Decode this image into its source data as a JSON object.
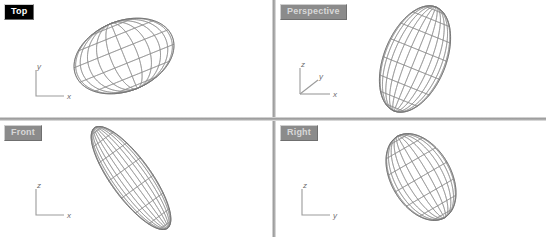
{
  "app": {
    "title": "CAD Modeler — Four Viewport Layout",
    "background_color": "#ffffff",
    "divider_color": "#9a9a9a",
    "wire_color": "#8e8e8e",
    "axis_color": "#9b9b9b"
  },
  "viewports": [
    {
      "id": "top",
      "label": "Top",
      "state": "active",
      "label_bg": "#000000",
      "label_fg": "#ffffff",
      "axes": [
        {
          "name": "y",
          "direction": "up"
        },
        {
          "name": "x",
          "direction": "right"
        }
      ],
      "object": {
        "name": "ellipsoid-wireframe",
        "shape": "ellipsoid",
        "rotation_deg": -22,
        "radius_x": 52,
        "radius_y": 35,
        "center_x": 124,
        "center_y": 56,
        "meridians": 12,
        "parallels": 7
      }
    },
    {
      "id": "perspective",
      "label": "Perspective",
      "state": "inactive",
      "label_bg": "#8b8b8b",
      "label_fg": "#d8d8d8",
      "axes": [
        {
          "name": "z",
          "direction": "up"
        },
        {
          "name": "y",
          "direction": "diagonal"
        },
        {
          "name": "x",
          "direction": "right"
        }
      ],
      "object": {
        "name": "ellipsoid-wireframe",
        "shape": "ellipsoid",
        "rotation_deg": 22,
        "radius_x": 31,
        "radius_y": 56,
        "center_x": 139,
        "center_y": 59,
        "meridians": 12,
        "parallels": 9
      }
    },
    {
      "id": "front",
      "label": "Front",
      "state": "inactive",
      "label_bg": "#8b8b8b",
      "label_fg": "#d8d8d8",
      "axes": [
        {
          "name": "z",
          "direction": "up"
        },
        {
          "name": "x",
          "direction": "right"
        }
      ],
      "object": {
        "name": "ellipsoid-wireframe",
        "shape": "ellipsoid",
        "rotation_deg": -36,
        "radius_x": 20,
        "radius_y": 62,
        "center_x": 131,
        "center_y": 57,
        "meridians": 12,
        "parallels": 9
      }
    },
    {
      "id": "right",
      "label": "Right",
      "state": "inactive",
      "label_bg": "#8b8b8b",
      "label_fg": "#d8d8d8",
      "axes": [
        {
          "name": "z",
          "direction": "up"
        },
        {
          "name": "y",
          "direction": "right"
        }
      ],
      "object": {
        "name": "ellipsoid-wireframe",
        "shape": "ellipsoid",
        "rotation_deg": -30,
        "radius_x": 30,
        "radius_y": 47,
        "center_x": 145,
        "center_y": 56,
        "meridians": 12,
        "parallels": 8
      }
    }
  ],
  "axis_labels": {
    "x": "x",
    "y": "y",
    "z": "z"
  }
}
